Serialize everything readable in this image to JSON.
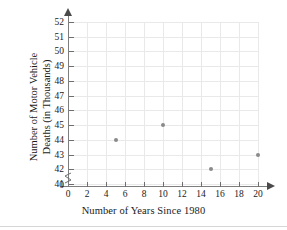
{
  "chart_data": {
    "type": "scatter",
    "title": "",
    "xlabel": "Number of Years Since 1980",
    "ylabel": "Number of Motor Vehicle Deaths (in Thousands)",
    "ylabel_line1": "Number of Motor Vehicle",
    "ylabel_line2": "Deaths (in Thousands)",
    "x": [
      5,
      10,
      15,
      20
    ],
    "values": [
      44,
      45,
      42,
      43
    ],
    "points": [
      {
        "x": 5,
        "y": 44
      },
      {
        "x": 10,
        "y": 45
      },
      {
        "x": 15,
        "y": 42
      },
      {
        "x": 20,
        "y": 43
      }
    ],
    "xticks": [
      0,
      2,
      4,
      6,
      8,
      10,
      12,
      14,
      16,
      18,
      20
    ],
    "yticks": [
      41,
      42,
      43,
      44,
      45,
      46,
      47,
      48,
      49,
      50,
      51,
      52
    ],
    "y_origin_label": "0",
    "xlim": [
      0,
      20
    ],
    "ylim": [
      41,
      52
    ],
    "y_axis_break": true,
    "grid": true,
    "legend": "none",
    "point_color": "#8a8a8a",
    "grid_color": "#e9e9e9",
    "axis_color": "#7e7e7e",
    "text_color": "#1a1a1a"
  }
}
